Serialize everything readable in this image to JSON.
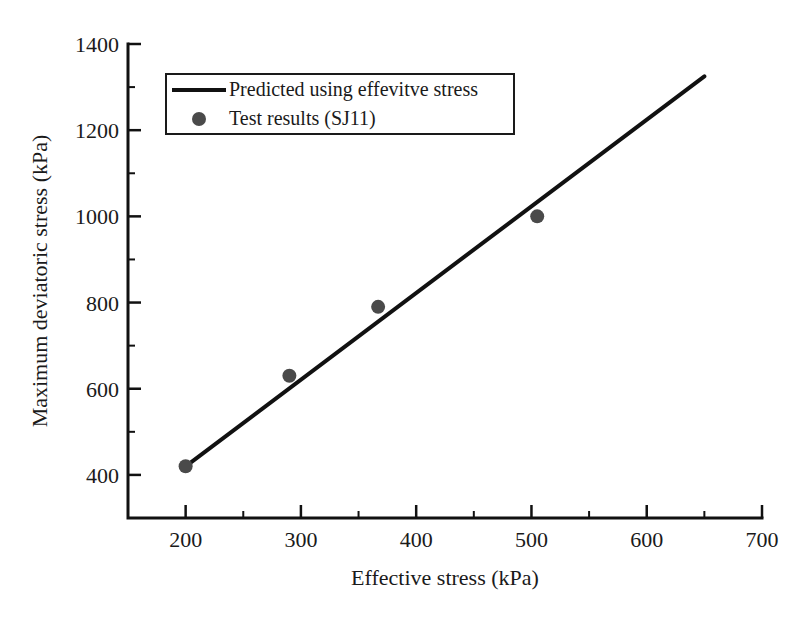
{
  "figure": {
    "xlabel": "Effective stress (kPa)",
    "ylabel": "Maximum deviatoric stress (kPa)"
  },
  "colors": {
    "axis": "#111111",
    "text": "#1a1a1a",
    "line": "#111111",
    "marker": "#4a4a4a",
    "background": "#ffffff"
  },
  "chart_data": {
    "type": "scatter",
    "title": "",
    "xlabel": "Effective stress (kPa)",
    "ylabel": "Maximum deviatoric stress (kPa)",
    "xlim": [
      150,
      700
    ],
    "ylim": [
      300,
      1400
    ],
    "x_major_ticks": [
      200,
      300,
      400,
      500,
      600,
      700
    ],
    "x_minor_ticks": [
      250,
      350,
      450,
      550,
      650
    ],
    "y_major_ticks": [
      400,
      600,
      800,
      1000,
      1200,
      1400
    ],
    "y_minor_ticks": [
      500,
      700,
      900,
      1100,
      1300
    ],
    "grid": false,
    "legend_position": "top-left-inside",
    "series": [
      {
        "name": "Predicted using effevitve stress",
        "type": "line",
        "color": "#111111",
        "points": [
          [
            200,
            420
          ],
          [
            650,
            1325
          ]
        ]
      },
      {
        "name": "Test results (SJ11)",
        "type": "scatter",
        "color": "#4a4a4a",
        "marker": "circle",
        "points": [
          [
            200,
            420
          ],
          [
            290,
            630
          ],
          [
            367,
            790
          ],
          [
            505,
            1000
          ]
        ]
      }
    ]
  }
}
